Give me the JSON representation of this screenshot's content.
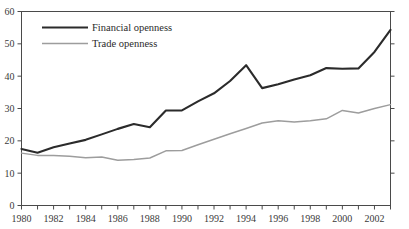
{
  "chart_data": {
    "type": "line",
    "title": "",
    "xlabel": "",
    "ylabel": "",
    "xlim": [
      1980,
      2003
    ],
    "ylim": [
      0,
      60
    ],
    "grid": false,
    "legend_position": "top-left",
    "x": [
      1980,
      1981,
      1982,
      1983,
      1984,
      1985,
      1986,
      1987,
      1988,
      1989,
      1990,
      1991,
      1992,
      1993,
      1994,
      1995,
      1996,
      1997,
      1998,
      1999,
      2000,
      2001,
      2002,
      2003
    ],
    "x_tick_labels": [
      "1980",
      "1982",
      "1984",
      "1986",
      "1988",
      "1990",
      "1992",
      "1994",
      "1996",
      "1998",
      "2000",
      "2002"
    ],
    "x_tick_values": [
      1980,
      1982,
      1984,
      1986,
      1988,
      1990,
      1992,
      1994,
      1996,
      1998,
      2000,
      2002
    ],
    "y_tick_labels": [
      "0",
      "10",
      "20",
      "30",
      "40",
      "50",
      "60"
    ],
    "y_tick_values": [
      0,
      10,
      20,
      30,
      40,
      50,
      60
    ],
    "series": [
      {
        "name": "Financial openness",
        "color": "#2b2b2b",
        "values": [
          17.5,
          16.3,
          18.0,
          19.2,
          20.3,
          22.0,
          23.7,
          25.2,
          24.2,
          29.4,
          29.4,
          32.2,
          34.7,
          38.5,
          43.4,
          36.3,
          37.5,
          39.0,
          40.3,
          42.5,
          42.3,
          42.4,
          47.5,
          54.3
        ]
      },
      {
        "name": "Trade openness",
        "color": "#9d9d9d",
        "values": [
          16.2,
          15.5,
          15.5,
          15.2,
          14.8,
          15.0,
          14.0,
          14.2,
          14.7,
          16.9,
          17.0,
          18.8,
          20.5,
          22.2,
          23.8,
          25.5,
          26.2,
          25.8,
          26.2,
          26.8,
          29.4,
          28.6,
          30.0,
          31.2
        ]
      }
    ]
  },
  "legend": {
    "entries": [
      {
        "label": "Financial openness"
      },
      {
        "label": "Trade openness"
      }
    ]
  }
}
